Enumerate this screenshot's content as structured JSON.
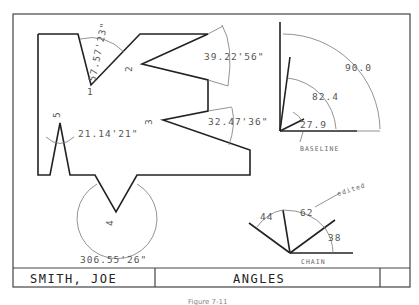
{
  "title_block": {
    "name": "SMITH, JOE",
    "title": "ANGLES",
    "blank_cell": ""
  },
  "caption": "Figure 7-11",
  "part": {
    "vertex_labels": [
      "1",
      "2",
      "3",
      "4",
      "5"
    ],
    "angle_dimensions": [
      {
        "vertex": "1",
        "value": "57.57'23\""
      },
      {
        "vertex": "2",
        "value": "39.22'56\""
      },
      {
        "vertex": "3",
        "value": "32.47'36\""
      },
      {
        "vertex": "4",
        "value": "306.55'26\""
      },
      {
        "vertex": "5",
        "value": "21.14'21\""
      }
    ]
  },
  "baseline_group": {
    "label": "BASELINE",
    "angles": [
      "90.0",
      "82.4",
      "27.9"
    ]
  },
  "chain_group": {
    "label": "CHAIN",
    "angles": [
      "44",
      "62",
      "38"
    ],
    "note": "edited"
  }
}
